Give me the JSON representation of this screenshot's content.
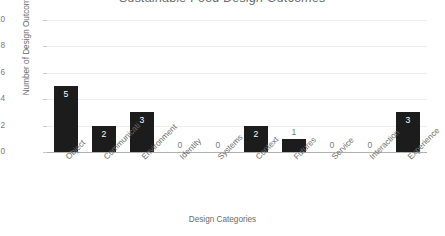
{
  "chart_data": {
    "type": "bar",
    "title": "Sustainable Food Design Outcomes",
    "xlabel": "Design Categories",
    "ylabel": "Number of Design Outcomes",
    "categories": [
      "Object",
      "Communicati",
      "Environment",
      "Identity",
      "Systems",
      "Context",
      "Futures",
      "Service",
      "Interaction",
      "Experience"
    ],
    "values": [
      5,
      2,
      3,
      0,
      0,
      2,
      1,
      0,
      0,
      3
    ],
    "value_labels": [
      "5",
      "2",
      "3",
      "0",
      "0",
      "2",
      "1",
      "0",
      "0",
      "3"
    ],
    "ylim": [
      0,
      10
    ],
    "ytick_labels": [
      "10",
      "8",
      "6",
      "4",
      "2",
      "0"
    ],
    "yticks": [
      10,
      8,
      6,
      4,
      2,
      0
    ],
    "grid": true,
    "legend": false,
    "bar_color": "#1c1c1c",
    "gridline_color": "#ededed",
    "axis_color": "#b0b0b0",
    "text_color": "#6b6b6b"
  }
}
